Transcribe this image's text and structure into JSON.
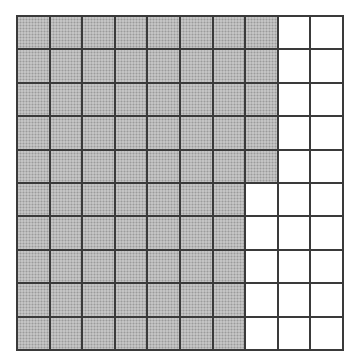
{
  "caption": {
    "text": "",
    "note": "partially cut-off illegible heading at top edge"
  },
  "grid": {
    "rows": 10,
    "columns": 10,
    "shaded_per_row": [
      8,
      8,
      8,
      8,
      8,
      7,
      7,
      7,
      7,
      7
    ],
    "total_cells": 100,
    "total_shaded": 75,
    "colors": {
      "shaded": "#b3b3b3",
      "unshaded": "#ffffff",
      "line": "#3a3a3a"
    }
  }
}
